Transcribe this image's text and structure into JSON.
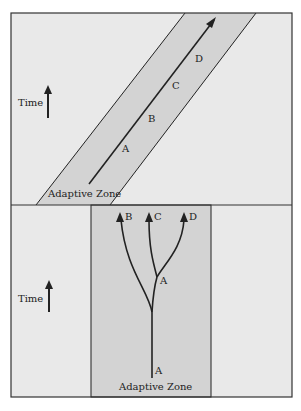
{
  "colors": {
    "background": "#e9e9e9",
    "zone": "#d3d3d3",
    "line": "#222222",
    "page": "#ffffff"
  },
  "top_panel": {
    "name": "anagenesis",
    "time_label": "Time",
    "zone_label": "Adaptive Zone",
    "lineage_labels": [
      "A",
      "B",
      "C",
      "D"
    ]
  },
  "bottom_panel": {
    "name": "cladogenesis",
    "time_label": "Time",
    "zone_label": "Adaptive Zone",
    "ancestor_label": "A",
    "branch_point_label": "A",
    "tip_labels": [
      "B",
      "C",
      "D"
    ]
  }
}
